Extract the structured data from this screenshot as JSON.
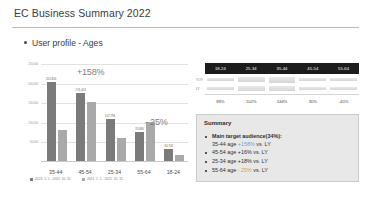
{
  "slide": {
    "title": "EC Business Summary 2022",
    "section_heading": "User profile - Ages"
  },
  "chart_data": {
    "type": "bar",
    "title": "User profile - Ages",
    "xlabel": "",
    "ylabel": "",
    "categories": [
      "35-44",
      "45-54",
      "25-34",
      "55-64",
      "18-24"
    ],
    "series": [
      {
        "name": "2022. 1. 1 - 2022. 10. 31",
        "color": "#7b7b7b",
        "values": [
          201801,
          174403,
          107794,
          74846,
          30741
        ]
      },
      {
        "name": "2021. 1. 1 - 2021. 10. 31",
        "color": "#a9a9a9",
        "values": [
          78200,
          150300,
          59600,
          99800,
          14900
        ]
      }
    ],
    "value_labels": [
      "201,801",
      "174,403",
      "107,794",
      "74,846",
      "30,741"
    ],
    "yticks": [
      "250,000",
      "200,000",
      "150,000",
      "100,000",
      "50,000"
    ],
    "ylim": [
      0,
      250000
    ],
    "grid": true,
    "legend_position": "bottom",
    "annotations": [
      {
        "text": "+158%",
        "category": "35-44"
      },
      {
        "text": "- 25%",
        "category": "55-64"
      }
    ]
  },
  "table": {
    "columns": [
      "18-24",
      "25-34",
      "35-44",
      "45-54",
      "55-64"
    ],
    "rows": [
      {
        "label": "YOY",
        "fills": [
          34,
          52,
          72,
          40,
          24
        ]
      },
      {
        "label": "LY",
        "fills": [
          38,
          51,
          50,
          46,
          40
        ]
      }
    ],
    "percent_row": [
      "89%",
      "102%",
      "144%",
      "30%",
      "-40%"
    ]
  },
  "summary": {
    "title": "Summary",
    "items": [
      {
        "prefix": "Main target audience(34%):",
        "second_line": "35-44 age ",
        "pct": "+158%",
        "pct_dir": "up",
        "suffix": " vs. LY"
      },
      {
        "prefix": "45-54 age ",
        "pct": "+16%",
        "pct_dir": "plain",
        "suffix": " vs. LY"
      },
      {
        "prefix": "25-34 age ",
        "pct": "+18%",
        "pct_dir": "plain",
        "suffix": " vs. LY"
      },
      {
        "prefix": "55-64 age ",
        "pct": "- 25%",
        "pct_dir": "down",
        "suffix": " vs. LY"
      }
    ]
  }
}
